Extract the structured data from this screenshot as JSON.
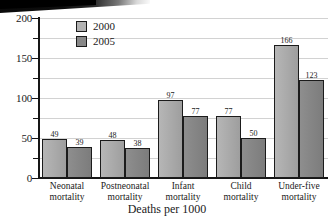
{
  "chart_data": {
    "type": "bar",
    "title": "",
    "xlabel": "Deaths per 1000",
    "ylabel": "",
    "categories": [
      "Neonatal mortality",
      "Postneonatal mortality",
      "Infant mortality",
      "Child mortality",
      "Under-five mortality"
    ],
    "category_lines": [
      [
        "Neonatal",
        "mortality"
      ],
      [
        "Postneonatal",
        "mortality"
      ],
      [
        "Infant",
        "mortality"
      ],
      [
        "Child",
        "mortality"
      ],
      [
        "Under-five",
        "mortality"
      ]
    ],
    "series": [
      {
        "name": "2000",
        "values": [
          49,
          48,
          97,
          77,
          166
        ],
        "color": "#b3b3b3"
      },
      {
        "name": "2005",
        "values": [
          39,
          38,
          77,
          50,
          123
        ],
        "color": "#888888"
      }
    ],
    "ylim": [
      0,
      200
    ],
    "yticks": [
      0,
      50,
      100,
      150,
      200
    ],
    "ytick_labels": [
      "0",
      "50",
      "100",
      "150",
      "200"
    ],
    "yminor_ticks": [
      25,
      75,
      125,
      175
    ],
    "grid": true,
    "grid_color": "#d2d2d2",
    "legend_position": "top-left-inside",
    "axis_color": "#161616",
    "background": "#ffffff"
  },
  "legend": {
    "entries": [
      {
        "label": "2000"
      },
      {
        "label": "2005"
      }
    ]
  },
  "axis": {
    "x_title": "Deaths per 1000"
  }
}
